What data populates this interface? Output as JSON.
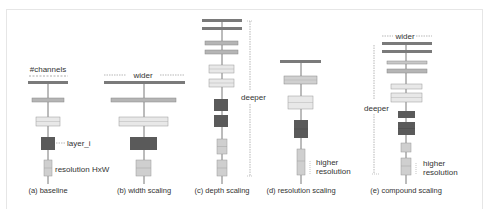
{
  "colors": {
    "top_bar": "#7a7a7a",
    "mid_bar": "#b5b5b5",
    "light_box": "#e8e8e8",
    "dark_box": "#5a5a5a",
    "res_box": "#cfcfcf",
    "line": "#555555",
    "dotted": "#888888"
  },
  "panels": [
    {
      "id": "a",
      "caption": "(a) baseline",
      "labels": {
        "channels": "#channels",
        "layer": "layer_i",
        "resolution": "resolution HxW"
      }
    },
    {
      "id": "b",
      "caption": "(b) width scaling",
      "labels": {
        "wider": "wider"
      }
    },
    {
      "id": "c",
      "caption": "(c) depth scaling",
      "labels": {
        "deeper": "deeper"
      }
    },
    {
      "id": "d",
      "caption": "(d) resolution scaling",
      "labels": {
        "higher": "higher",
        "resolution": "resolution"
      }
    },
    {
      "id": "e",
      "caption": "(e) compound scaling",
      "labels": {
        "wider": "wider",
        "deeper": "deeper",
        "higher": "higher",
        "resolution": "resolution"
      }
    }
  ]
}
